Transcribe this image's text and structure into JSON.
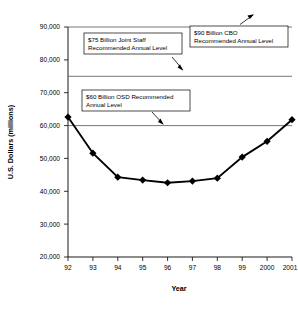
{
  "chart_data": {
    "type": "line",
    "title": "",
    "xlabel": "Year",
    "ylabel": "U.S. Dollars (millions)",
    "categories": [
      "92",
      "93",
      "94",
      "95",
      "96",
      "97",
      "98",
      "99",
      "2000",
      "2001"
    ],
    "values": [
      62600,
      51600,
      44300,
      43400,
      42600,
      43100,
      44000,
      50400,
      55200,
      61800
    ],
    "series": [
      {
        "name": "Annual Funding",
        "values": [
          62600,
          51600,
          44300,
          43400,
          42600,
          43100,
          44000,
          50400,
          55200,
          61800
        ]
      }
    ],
    "ylim": [
      20000,
      90000
    ],
    "ytick_values": [
      20000,
      30000,
      40000,
      50000,
      60000,
      70000,
      80000,
      90000
    ],
    "ytick_labels": [
      "20,000",
      "30,000",
      "40,000",
      "50,000",
      "60,000",
      "70,000",
      "80,000",
      "90,000"
    ],
    "grid": false,
    "legend": "none",
    "marker": "diamond",
    "line_color": "#000000",
    "reference_lines": [
      {
        "value": 90000,
        "label": "$90 Billion CBO Recommended Annual Level"
      },
      {
        "value": 75000,
        "label": "$75 Billion Joint Staff Recommended Annual Level"
      },
      {
        "value": 60000,
        "label": "$60 Billion OSD Recommended Annual Level"
      }
    ],
    "annotations": [
      {
        "id": "cbo",
        "line1": "$90 Billion CBO",
        "line2": "Recommended Annual Level",
        "target_value": 90000
      },
      {
        "id": "joint-staff",
        "line1": "$75 Billion Joint Staff",
        "line2": "Recommended Annual Level",
        "target_value": 75000
      },
      {
        "id": "osd",
        "line1": "$60 Billion OSD Recommended",
        "line2": "Annual Level",
        "target_value": 60000
      }
    ]
  }
}
